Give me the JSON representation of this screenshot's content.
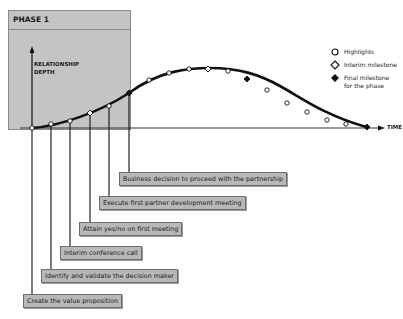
{
  "phase": {
    "title": "PHASE 1"
  },
  "axes": {
    "y_label": "RELATIONSHIP DEPTH",
    "x_label": "TIME"
  },
  "legend": [
    {
      "symbol": "open-circle",
      "label": "Highlights"
    },
    {
      "symbol": "open-diamond",
      "label": "Interim milestone"
    },
    {
      "symbol": "filled-diamond",
      "label": "Final milestone\nfor the phase"
    }
  ],
  "callouts": [
    {
      "label": "Business decision to proceed with the partnership"
    },
    {
      "label": "Execute first partner development meeting"
    },
    {
      "label": "Attain yes/no on first meeting"
    },
    {
      "label": "Interim conference call"
    },
    {
      "label": "Identify and validate the decision maker"
    },
    {
      "label": "Create the value proposition"
    }
  ],
  "colors": {
    "phase_fill": "#c4c4c4",
    "callout_fill": "#b8b8b8",
    "line": "#111111"
  }
}
